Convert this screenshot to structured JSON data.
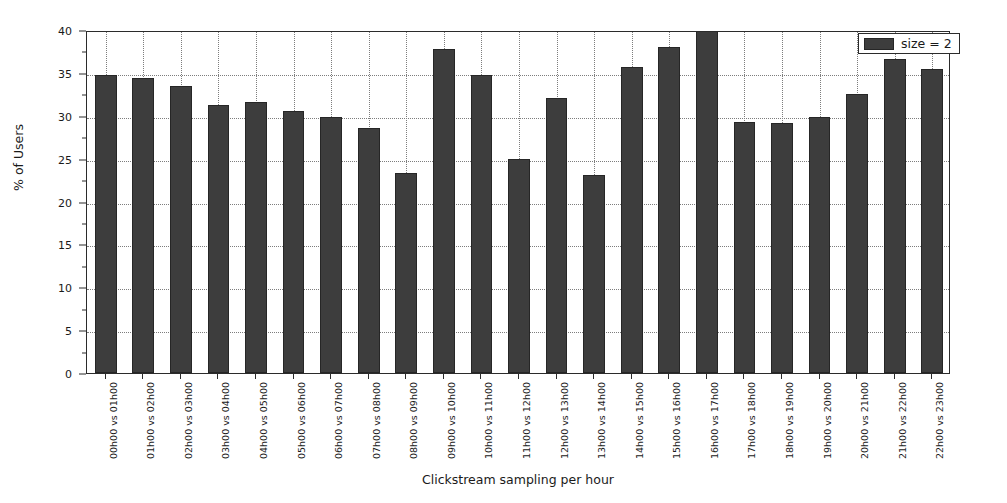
{
  "chart_data": {
    "type": "bar",
    "title": "",
    "xlabel": "Clickstream sampling per hour",
    "ylabel": "% of Users",
    "ylim": [
      0,
      40
    ],
    "yticks": [
      0,
      5,
      10,
      15,
      20,
      25,
      30,
      35,
      40
    ],
    "ytick_labels": [
      "0",
      "5",
      "10",
      "15",
      "20",
      "25",
      "30",
      "35",
      "40"
    ],
    "grid": "dotted-both",
    "legend_position": "upper-right",
    "legend": [
      "size = 2"
    ],
    "bar_color": "#3d3d3d",
    "bar_edge_color": "#262626",
    "axis_color": "#2b2b2b",
    "grid_color": "#7d7d7d",
    "background_color": "#ffffff",
    "categories": [
      "00h00 vs 01h00",
      "01h00 vs 02h00",
      "02h00 vs 03h00",
      "03h00 vs 04h00",
      "04h00 vs 05h00",
      "05h00 vs 06h00",
      "06h00 vs 07h00",
      "07h00 vs 08h00",
      "08h00 vs 09h00",
      "09h00 vs 10h00",
      "10h00 vs 11h00",
      "11h00 vs 12h00",
      "12h00 vs 13h00",
      "13h00 vs 14h00",
      "14h00 vs 15h00",
      "15h00 vs 16h00",
      "16h00 vs 17h00",
      "17h00 vs 18h00",
      "18h00 vs 19h00",
      "19h00 vs 20h00",
      "20h00 vs 21h00",
      "21h00 vs 22h00",
      "22h00 vs 23h00"
    ],
    "series": [
      {
        "name": "size = 2",
        "values": [
          34.7,
          34.4,
          33.5,
          31.2,
          31.6,
          30.5,
          29.8,
          28.6,
          23.3,
          37.8,
          34.7,
          24.9,
          32.1,
          23.1,
          35.7,
          38.0,
          40.0,
          29.3,
          29.1,
          29.8,
          32.5,
          36.6,
          35.4
        ]
      }
    ]
  },
  "legend": {
    "entry_label": "size = 2"
  }
}
